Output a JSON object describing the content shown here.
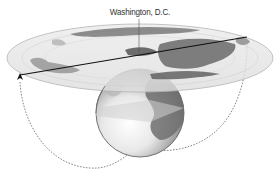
{
  "diagram": {
    "label": "Washington, D.C.",
    "elements": {
      "globe": {
        "cx": 140,
        "cy": 113,
        "r": 44
      },
      "map_disc": {
        "cx": 140,
        "cy": 58,
        "rx": 133,
        "ry": 34,
        "projection": "azimuthal-equidistant"
      },
      "straight_route": {
        "from": [
          20,
          75
        ],
        "to": [
          247,
          37
        ]
      },
      "great_circle_route": {
        "style": "dashed",
        "arrow_end": "left"
      }
    },
    "colors": {
      "disc_fill": "#e6e6e6",
      "disc_stroke": "#b8b8b8",
      "land": "#8c8c8c",
      "land_dark": "#5e5e5e",
      "globe_light": "#f4f4f4",
      "globe_dark": "#6a6a6a",
      "route_line": "#111111",
      "dashed_route": "#777777",
      "label": "#333333"
    }
  }
}
